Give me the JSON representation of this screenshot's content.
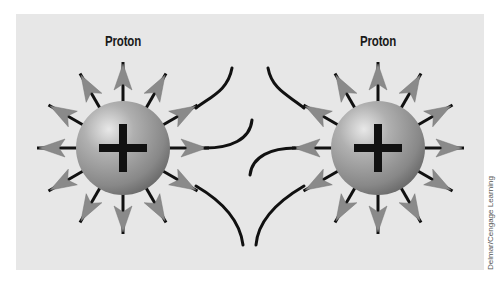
{
  "diagram": {
    "particles": [
      {
        "label": "Proton",
        "charge_symbol": "+",
        "center": [
          123,
          148
        ]
      },
      {
        "label": "Proton",
        "charge_symbol": "+",
        "center": [
          378,
          148
        ]
      }
    ],
    "field_arrows_per_particle": 12,
    "field_direction": "outward",
    "colors": {
      "background": "#e7e7e7",
      "sphere_light": "#d9d9d9",
      "sphere_dark": "#6e6e6e",
      "arrow_head": "#8a8a8a",
      "line": "#111111"
    }
  },
  "credit": "Delmar/Cengage Learning"
}
